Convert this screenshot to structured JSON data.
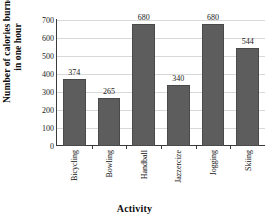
{
  "chart_data": {
    "type": "bar",
    "title": "",
    "xlabel": "Activity",
    "ylabel_line1": "Number of calories burned",
    "ylabel_line2": "in one hour",
    "categories": [
      "Bicycling",
      "Bowling",
      "Handball",
      "Jazzercize",
      "Jogging",
      "Skiing"
    ],
    "values": [
      374,
      265,
      680,
      340,
      680,
      544
    ],
    "value_labels": [
      "374",
      "265",
      "680",
      "340",
      "680",
      "544"
    ],
    "ylim": [
      0,
      700
    ],
    "yticks": [
      0,
      100,
      200,
      300,
      400,
      500,
      600,
      700
    ],
    "ytick_labels": [
      "0",
      "100",
      "200",
      "300",
      "400",
      "500",
      "600",
      "700"
    ],
    "grid": true,
    "legend": false,
    "bar_color": "#5d5d5d",
    "bar_edge_color": "#4a4a4a",
    "axis_color": "#3a3a3a",
    "grid_color": "#d8d8d8",
    "background": "#ffffff"
  }
}
